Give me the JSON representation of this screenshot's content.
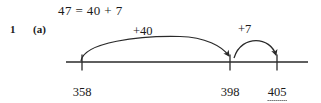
{
  "exercise": {
    "question_number": "1",
    "part_label": "(a)",
    "equation": "47 = 40 + 7"
  },
  "diagram": {
    "type": "number-line-jumps",
    "line": {
      "x_start": 66,
      "x_end": 308,
      "y": 62
    },
    "stroke_color": "#2a2a2a",
    "ticks": [
      {
        "value": "358",
        "x": 82,
        "is_blank": false
      },
      {
        "value": "398",
        "x": 230,
        "is_blank": false
      },
      {
        "value": "405",
        "x": 277,
        "is_blank": true
      }
    ],
    "jumps": [
      {
        "label": "+40",
        "from_x": 82,
        "to_x": 230,
        "peak_y": 39
      },
      {
        "label": "+7",
        "from_x": 233,
        "to_x": 277,
        "peak_y": 42
      }
    ]
  }
}
